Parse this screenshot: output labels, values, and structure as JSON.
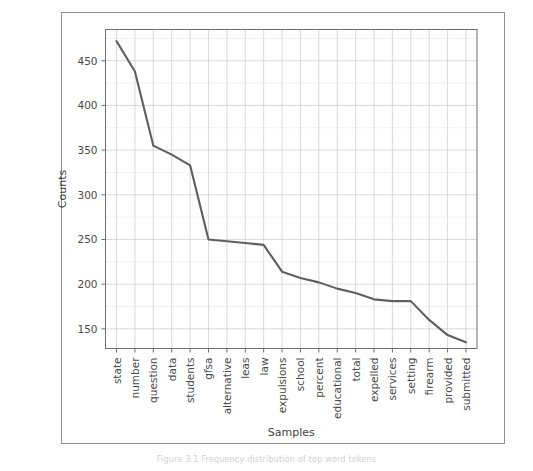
{
  "figure": {
    "caption": "Figure 3.1 Frequency distribution of top word tokens"
  },
  "chart_data": {
    "type": "line",
    "title": "",
    "xlabel": "Samples",
    "ylabel": "Counts",
    "categories": [
      "state",
      "number",
      "question",
      "data",
      "students",
      "gfsa",
      "alternative",
      "leas",
      "law",
      "expulsions",
      "school",
      "percent",
      "educational",
      "total",
      "expelled",
      "services",
      "setting",
      "firearm",
      "provided",
      "submitted"
    ],
    "values": [
      472,
      438,
      355,
      345,
      333,
      250,
      248,
      246,
      244,
      214,
      207,
      202,
      195,
      190,
      183,
      181,
      181,
      160,
      143,
      135
    ],
    "yticks": [
      150,
      200,
      250,
      300,
      350,
      400,
      450
    ],
    "yticklabels": [
      "150",
      "200",
      "250",
      "300",
      "350",
      "400",
      "450"
    ],
    "ylim": [
      128,
      485
    ],
    "xlim": [
      -0.6,
      19.6
    ],
    "grid": true,
    "legend": false,
    "line_color": "#5f5f5f",
    "grid_color": "#c9c9c9"
  }
}
